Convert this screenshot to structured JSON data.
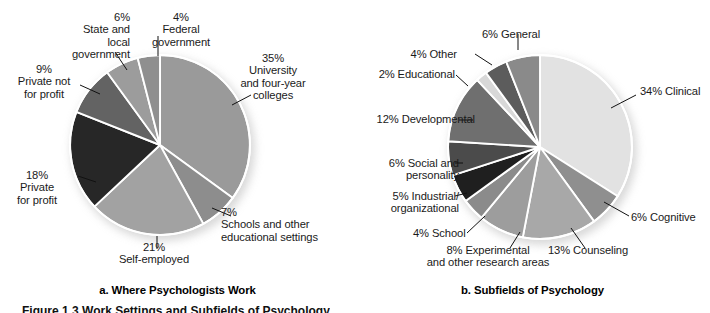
{
  "figure": {
    "caption_bottom": "Figure 1.3 Work Settings and Subfields of Psychology",
    "background": "#ffffff"
  },
  "panel_a": {
    "caption": "a. Where Psychologists Work"
  },
  "panel_b": {
    "caption": "b. Subfields of Psychology"
  },
  "chart_data": [
    {
      "type": "pie",
      "id": "where-psychologists-work",
      "title": "a. Where Psychologists Work",
      "total": 100,
      "start_angle_deg": 0,
      "direction": "clockwise",
      "labels": [
        "University and four-year colleges",
        "Schools and other educational settings",
        "Self-employed",
        "Private for profit",
        "Private not for profit",
        "State and local government",
        "Federal government"
      ],
      "values": [
        35,
        7,
        21,
        18,
        9,
        6,
        4
      ],
      "colors": [
        "#9a9a9a",
        "#8d8d8d",
        "#a2a2a2",
        "#272727",
        "#636363",
        "#9c9c9c",
        "#8f8f8f"
      ],
      "label_texts": [
        "35%\nUniversity\nand four-year\ncolleges",
        "7%\nSchools and other\neducational settings",
        "21%\nSelf-employed",
        "18%\nPrivate\nfor profit",
        "9%\nPrivate not\nfor profit",
        "6%\nState and\nlocal\ngovernment",
        "4%\nFederal\ngovernment"
      ],
      "legend": "none",
      "grid": false
    },
    {
      "type": "pie",
      "id": "subfields-of-psychology",
      "title": "b. Subfields of Psychology",
      "total": 100,
      "start_angle_deg": 0,
      "direction": "clockwise",
      "labels": [
        "Clinical",
        "Cognitive",
        "Counseling",
        "Experimental and other research areas",
        "School",
        "Industrial/organizational",
        "Social and personality",
        "Developmental",
        "Educational",
        "Other",
        "General"
      ],
      "values": [
        34,
        6,
        13,
        8,
        4,
        5,
        6,
        12,
        2,
        4,
        6
      ],
      "colors": [
        "#e2e2e2",
        "#8f8f8f",
        "#a8a8a8",
        "#9d9d9d",
        "#8b8b8b",
        "#1f1f1f",
        "#4b4b4b",
        "#6f6f6f",
        "#d8d8d8",
        "#5c5c5c",
        "#8a8a8a"
      ],
      "label_texts": [
        "34% Clinical",
        "6% Cognitive",
        "13% Counseling",
        "8% Experimental\nand other research areas",
        "4% School",
        "5% Industrial/\norganizational",
        "6% Social and\npersonality",
        "12% Developmental",
        "2% Educational",
        "4% Other",
        "6% General"
      ],
      "legend": "none",
      "grid": false
    }
  ]
}
